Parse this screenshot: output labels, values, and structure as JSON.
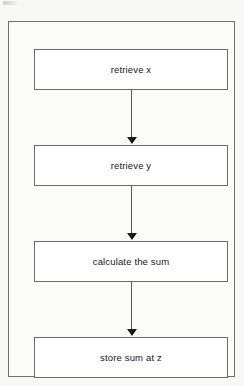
{
  "diagram": {
    "type": "flowchart",
    "orientation": "vertical",
    "colors": {
      "page_background": "#f8f8f7",
      "frame_background": "#fbfbfa",
      "frame_border": "#6e6e70",
      "box_fill": "#ffffff",
      "box_border": "#6b6b6d",
      "text": "#17171a",
      "arrow_shaft": "#58585b",
      "arrow_head": "#19191c"
    },
    "nodes": [
      {
        "id": "box-1",
        "label": "retrieve x",
        "shape": "process"
      },
      {
        "id": "box-2",
        "label": "retrieve y",
        "shape": "process"
      },
      {
        "id": "box-3",
        "label": "calculate the sum",
        "shape": "process"
      },
      {
        "id": "box-4",
        "label": "store sum at z",
        "shape": "process"
      }
    ],
    "connectors": [
      {
        "id": "arrow-1",
        "from": "box-1",
        "to": "box-2",
        "style": "solid-arrow-down"
      },
      {
        "id": "arrow-2",
        "from": "box-2",
        "to": "box-3",
        "style": "solid-arrow-down"
      },
      {
        "id": "arrow-3",
        "from": "box-3",
        "to": "box-4",
        "style": "solid-arrow-down"
      }
    ]
  }
}
